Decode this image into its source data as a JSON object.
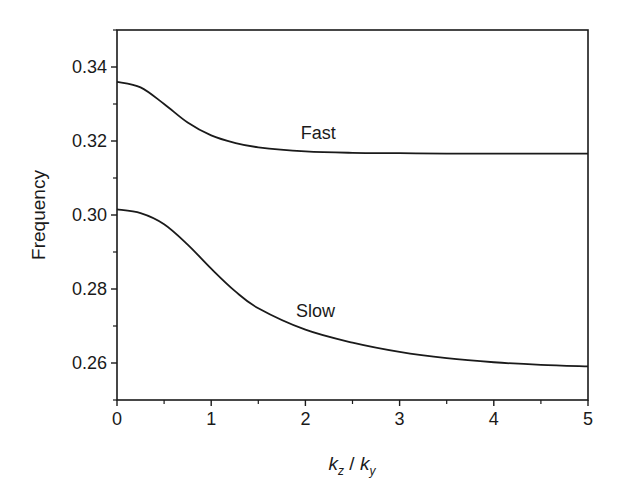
{
  "chart_data": {
    "type": "line",
    "title": "",
    "xlabel": "k_z / k_y",
    "xlabel_parts": {
      "k1": "k",
      "sub1": "z",
      "sep": " / ",
      "k2": "k",
      "sub2": "y"
    },
    "ylabel": "Frequency",
    "xlim": [
      0,
      5
    ],
    "ylim": [
      0.25,
      0.35
    ],
    "x_ticks": [
      0,
      1,
      2,
      3,
      4,
      5
    ],
    "x_tick_labels": [
      "0",
      "1",
      "2",
      "3",
      "4",
      "5"
    ],
    "y_ticks": [
      0.26,
      0.28,
      0.3,
      0.32,
      0.34
    ],
    "y_tick_labels": [
      "0.26",
      "0.28",
      "0.30",
      "0.32",
      "0.34"
    ],
    "grid": false,
    "legend": "none (inline curve labels)",
    "x": [
      0,
      0.25,
      0.5,
      0.75,
      1.0,
      1.25,
      1.5,
      2.0,
      2.5,
      3.0,
      3.5,
      4.0,
      4.5,
      5.0
    ],
    "series": [
      {
        "name": "Fast",
        "label_pos": {
          "x": 1.95,
          "y": 0.3205
        },
        "values": [
          0.336,
          0.3345,
          0.33,
          0.325,
          0.3215,
          0.3195,
          0.3183,
          0.3172,
          0.3168,
          0.3167,
          0.3166,
          0.3166,
          0.3166,
          0.3166
        ]
      },
      {
        "name": "Slow",
        "label_pos": {
          "x": 1.9,
          "y": 0.2725
        },
        "values": [
          0.3015,
          0.3005,
          0.2975,
          0.292,
          0.2855,
          0.2795,
          0.2748,
          0.269,
          0.2655,
          0.263,
          0.2613,
          0.2602,
          0.2595,
          0.2591
        ]
      }
    ]
  }
}
